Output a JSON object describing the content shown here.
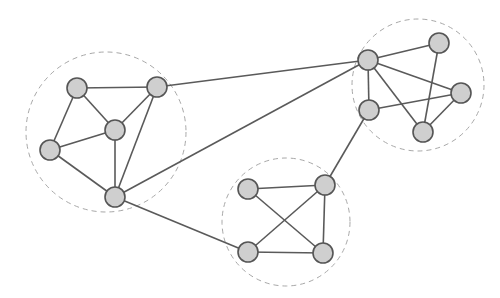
{
  "diagram": {
    "type": "clustered-network-graph",
    "colors": {
      "background": "#ffffff",
      "node_fill": "#cfcfcf",
      "node_stroke": "#555555",
      "edge": "#5a5a5a",
      "cluster_boundary": "#a8a8a8"
    },
    "clusters": [
      {
        "id": "left",
        "cx": 106,
        "cy": 132,
        "r": 80
      },
      {
        "id": "right",
        "cx": 418,
        "cy": 85,
        "r": 66
      },
      {
        "id": "bottom",
        "cx": 286,
        "cy": 222,
        "r": 64
      }
    ],
    "nodes": [
      {
        "id": "A",
        "cluster": "left",
        "x": 77,
        "y": 88
      },
      {
        "id": "B",
        "cluster": "left",
        "x": 157,
        "y": 87
      },
      {
        "id": "C",
        "cluster": "left",
        "x": 115,
        "y": 130
      },
      {
        "id": "D",
        "cluster": "left",
        "x": 50,
        "y": 150
      },
      {
        "id": "E",
        "cluster": "left",
        "x": 115,
        "y": 197
      },
      {
        "id": "F",
        "cluster": "right",
        "x": 368,
        "y": 60
      },
      {
        "id": "G",
        "cluster": "right",
        "x": 439,
        "y": 43
      },
      {
        "id": "H",
        "cluster": "right",
        "x": 461,
        "y": 93
      },
      {
        "id": "I",
        "cluster": "right",
        "x": 369,
        "y": 110
      },
      {
        "id": "J",
        "cluster": "right",
        "x": 423,
        "y": 132
      },
      {
        "id": "K",
        "cluster": "bottom",
        "x": 248,
        "y": 189
      },
      {
        "id": "L",
        "cluster": "bottom",
        "x": 325,
        "y": 185
      },
      {
        "id": "M",
        "cluster": "bottom",
        "x": 248,
        "y": 252
      },
      {
        "id": "N",
        "cluster": "bottom",
        "x": 323,
        "y": 253
      }
    ],
    "edges": [
      [
        "A",
        "B"
      ],
      [
        "A",
        "C"
      ],
      [
        "A",
        "D"
      ],
      [
        "B",
        "C"
      ],
      [
        "B",
        "E"
      ],
      [
        "C",
        "D"
      ],
      [
        "C",
        "E"
      ],
      [
        "D",
        "E"
      ],
      [
        "F",
        "G"
      ],
      [
        "F",
        "H"
      ],
      [
        "F",
        "I"
      ],
      [
        "F",
        "J"
      ],
      [
        "I",
        "H"
      ],
      [
        "G",
        "J"
      ],
      [
        "H",
        "J"
      ],
      [
        "K",
        "L"
      ],
      [
        "K",
        "N"
      ],
      [
        "L",
        "M"
      ],
      [
        "L",
        "N"
      ],
      [
        "M",
        "N"
      ],
      [
        "B",
        "F"
      ],
      [
        "E",
        "F"
      ],
      [
        "E",
        "M"
      ],
      [
        "I",
        "L"
      ]
    ],
    "node_radius": 10
  }
}
